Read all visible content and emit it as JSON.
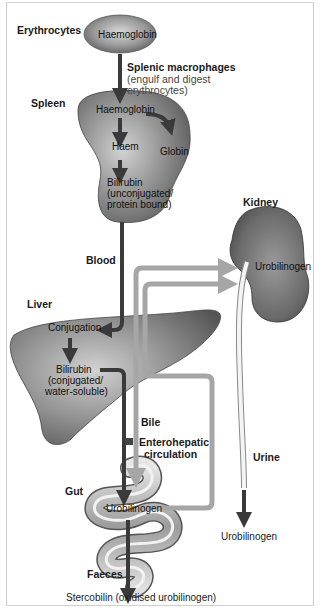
{
  "labels": {
    "erythrocytes": "Erythrocytes",
    "haemoglobin_rbc": "Haemoglobin",
    "splenic_macrophages": "Splenic macrophages",
    "splenic_note_1": "(engulf and digest",
    "splenic_note_2": "erythrocytes)",
    "spleen": "Spleen",
    "haemoglobin_spleen": "Haemoglobin",
    "haem": "Haem",
    "globin": "Globin",
    "bilirubin_unconj_1": "Bilirubin",
    "bilirubin_unconj_2": "(unconjugated/",
    "bilirubin_unconj_3": "protein bound)",
    "kidney": "Kidney",
    "urobilinogen_kidney": "Urobilinogen",
    "blood": "Blood",
    "liver": "Liver",
    "conjugation": "Conjugation",
    "bilirubin_conj_1": "Bilirubin",
    "bilirubin_conj_2": "(conjugated/",
    "bilirubin_conj_3": "water-soluble)",
    "bile": "Bile",
    "enterohepatic_1": "Enterohepatic",
    "enterohepatic_2": "circulation",
    "urine": "Urine",
    "gut": "Gut",
    "urobilinogen_gut": "Urobilinogen",
    "urobilinogen_urine": "Urobilinogen",
    "faeces": "Faeces",
    "stercobilin": "Stercobilin (oxidised urobilinogen)"
  },
  "colors": {
    "dark_arrow": "#3a3a3a",
    "light_arrow": "#a6a6a6",
    "organ_dark": "#6e6e6e",
    "organ_light": "#c4c4c4",
    "frame": "#cfcfcf"
  }
}
